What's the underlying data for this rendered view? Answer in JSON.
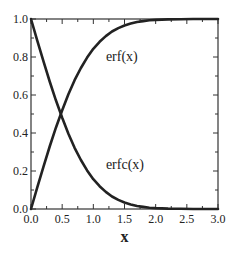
{
  "chart_data": {
    "type": "line",
    "title": "",
    "xlabel": "x",
    "ylabel": "",
    "xlim": [
      0.0,
      3.0
    ],
    "ylim": [
      0.0,
      1.0
    ],
    "x_ticks": [
      "0.0",
      "0.5",
      "1.0",
      "1.5",
      "2.0",
      "2.5",
      "3.0"
    ],
    "y_ticks": [
      "0.0",
      "0.2",
      "0.4",
      "0.6",
      "0.8",
      "1.0"
    ],
    "x_minor_step": 0.25,
    "y_minor_step": 0.1,
    "grid": false,
    "legend": "none",
    "annotations": [
      {
        "text": "erf(x)",
        "x": 1.25,
        "y": 0.8
      },
      {
        "text": "erfc(x)",
        "x": 1.25,
        "y": 0.23
      }
    ],
    "series": [
      {
        "name": "erf(x)",
        "x": [
          0.0,
          0.1,
          0.2,
          0.3,
          0.4,
          0.5,
          0.6,
          0.7,
          0.8,
          0.9,
          1.0,
          1.1,
          1.2,
          1.3,
          1.4,
          1.5,
          1.6,
          1.7,
          1.8,
          1.9,
          2.0,
          2.2,
          2.4,
          2.6,
          2.8,
          3.0
        ],
        "values": [
          0.0,
          0.112,
          0.223,
          0.329,
          0.428,
          0.52,
          0.604,
          0.678,
          0.742,
          0.797,
          0.843,
          0.88,
          0.91,
          0.934,
          0.952,
          0.966,
          0.976,
          0.984,
          0.989,
          0.993,
          0.995,
          0.998,
          0.999,
          1.0,
          1.0,
          1.0
        ]
      },
      {
        "name": "erfc(x)",
        "x": [
          0.0,
          0.1,
          0.2,
          0.3,
          0.4,
          0.5,
          0.6,
          0.7,
          0.8,
          0.9,
          1.0,
          1.1,
          1.2,
          1.3,
          1.4,
          1.5,
          1.6,
          1.7,
          1.8,
          1.9,
          2.0,
          2.2,
          2.4,
          2.6,
          2.8,
          3.0
        ],
        "values": [
          1.0,
          0.888,
          0.777,
          0.671,
          0.572,
          0.48,
          0.396,
          0.322,
          0.258,
          0.203,
          0.157,
          0.12,
          0.09,
          0.066,
          0.048,
          0.034,
          0.024,
          0.016,
          0.011,
          0.007,
          0.005,
          0.002,
          0.001,
          0.0,
          0.0,
          0.0
        ]
      }
    ]
  }
}
